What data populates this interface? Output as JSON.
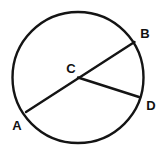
{
  "figure": {
    "background_color": "#ffffff",
    "stroke_color": "#141414",
    "label_color": "#111111",
    "width": 164,
    "height": 156
  },
  "circle": {
    "name": "circle-outline",
    "center_x": 78,
    "center_y": 77.5,
    "radius": 65.5,
    "stroke_width": 2.4
  },
  "segments": [
    {
      "name": "segment-ab",
      "label": "AB",
      "x1": 26,
      "y1": 112,
      "x2": 134.5,
      "y2": 42,
      "stroke_width": 2.4
    },
    {
      "name": "segment-cd",
      "label": "CD",
      "x1": 78,
      "y1": 77.5,
      "x2": 139,
      "y2": 97,
      "stroke_width": 2.4
    }
  ],
  "labels": [
    {
      "id": "label-a",
      "text": "A",
      "x": 17,
      "y": 130,
      "anchor": "middle"
    },
    {
      "id": "label-b",
      "text": "B",
      "x": 145,
      "y": 38,
      "anchor": "middle"
    },
    {
      "id": "label-c",
      "text": "C",
      "x": 71,
      "y": 73,
      "anchor": "middle"
    },
    {
      "id": "label-d",
      "text": "D",
      "x": 151,
      "y": 110,
      "anchor": "middle"
    }
  ]
}
